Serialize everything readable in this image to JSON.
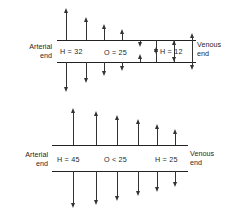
{
  "figure": {
    "stroke_color": "#333333",
    "text_color": "#1f1f1f",
    "background": "#ffffff"
  },
  "panels": [
    {
      "id": "panel-top",
      "name": "normal-capillary-exchange",
      "arterial_end_label": {
        "line1": "Arterial",
        "line2": "end"
      },
      "venous_end_label": {
        "line1": "Venous",
        "line2": "end"
      },
      "arterial_pressure_label": "H = 32",
      "oncotic_pressure_label": "O = 25",
      "venous_pressure_label": "H = 12",
      "upper_line": {
        "name": "upper-axis-line",
        "x1": 57,
        "x2": 196,
        "y": 40
      },
      "lower_line": {
        "name": "lower-axis-line",
        "x1": 57,
        "x2": 196,
        "y": 62
      },
      "upper_arrows": [
        {
          "x": 66,
          "length": 28,
          "direction": "up"
        },
        {
          "x": 86,
          "length": 19,
          "direction": "up"
        },
        {
          "x": 104,
          "length": 12,
          "direction": "up"
        },
        {
          "x": 122,
          "length": 7,
          "direction": "up"
        },
        {
          "x": 140,
          "length": 3,
          "direction": "down"
        },
        {
          "x": 156,
          "length": 10,
          "direction": "down"
        },
        {
          "x": 174,
          "length": 18,
          "direction": "down"
        },
        {
          "x": 192,
          "length": 26,
          "direction": "down"
        }
      ],
      "lower_arrows": [
        {
          "x": 66,
          "length": 26,
          "direction": "down"
        },
        {
          "x": 86,
          "length": 17,
          "direction": "down"
        },
        {
          "x": 104,
          "length": 10,
          "direction": "down"
        },
        {
          "x": 122,
          "length": 5,
          "direction": "down"
        },
        {
          "x": 140,
          "length": 4,
          "direction": "up"
        },
        {
          "x": 156,
          "length": 11,
          "direction": "up"
        },
        {
          "x": 174,
          "length": 18,
          "direction": "up"
        },
        {
          "x": 192,
          "length": 25,
          "direction": "up"
        }
      ]
    },
    {
      "id": "panel-bottom",
      "name": "edema-capillary-exchange",
      "arterial_end_label": {
        "line1": "Arterial",
        "line2": "end"
      },
      "venous_end_label": {
        "line1": "Venous",
        "line2": "end"
      },
      "arterial_pressure_label": "H = 45",
      "oncotic_pressure_label": "O < 25",
      "venous_pressure_label": "H = 25",
      "upper_line": {
        "name": "upper-axis-line",
        "x1": 52,
        "x2": 188,
        "y": 40
      },
      "lower_line": {
        "name": "lower-axis-line",
        "x1": 52,
        "x2": 188,
        "y": 66
      },
      "upper_arrows": [
        {
          "x": 73,
          "length": 33,
          "direction": "up"
        },
        {
          "x": 96,
          "length": 30,
          "direction": "up"
        },
        {
          "x": 117,
          "length": 26,
          "direction": "up"
        },
        {
          "x": 138,
          "length": 22,
          "direction": "up"
        },
        {
          "x": 157,
          "length": 17,
          "direction": "up"
        },
        {
          "x": 175,
          "length": 12,
          "direction": "up"
        }
      ],
      "lower_arrows": [
        {
          "x": 73,
          "length": 33,
          "direction": "down"
        },
        {
          "x": 96,
          "length": 30,
          "direction": "down"
        },
        {
          "x": 117,
          "length": 26,
          "direction": "down"
        },
        {
          "x": 138,
          "length": 21,
          "direction": "down"
        },
        {
          "x": 157,
          "length": 17,
          "direction": "down"
        },
        {
          "x": 175,
          "length": 12,
          "direction": "down"
        }
      ]
    }
  ]
}
